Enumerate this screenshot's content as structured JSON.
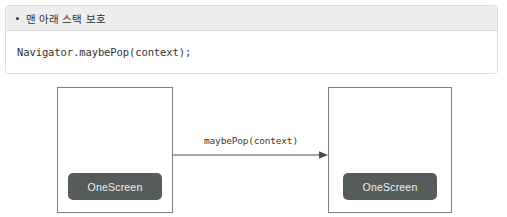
{
  "note": {
    "bullet_icon": "bullet-dot-icon",
    "title": "맨 아래 스택 보호",
    "code": "Navigator.maybePop(context);"
  },
  "diagram": {
    "type": "flow",
    "nodes": [
      {
        "id": "left",
        "button_label": "OneScreen"
      },
      {
        "id": "right",
        "button_label": "OneScreen"
      }
    ],
    "edges": [
      {
        "from": "left",
        "to": "right",
        "label": "maybePop(context)",
        "direction": "right"
      }
    ]
  },
  "colors": {
    "panel_border": "#dddddd",
    "panel_header_bg": "#eeeeee",
    "box_border": "#808080",
    "button_bg": "#565b5b",
    "button_text": "#f2f2f2",
    "arrow": "#4d4d4d",
    "page_bg": "#ffffff"
  }
}
